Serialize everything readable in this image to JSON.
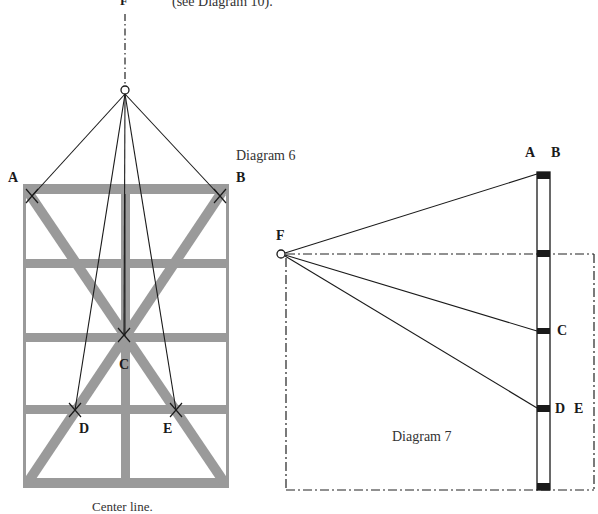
{
  "top_note": "(see Diagram 10).",
  "diagram6": {
    "caption": "Diagram 6",
    "footer": "Center line.",
    "labels": {
      "F": "F",
      "A": "A",
      "B": "B",
      "C": "C",
      "D": "D",
      "E": "E"
    },
    "frame_color": "#9a9a9a",
    "line_color": "#1a1a1a"
  },
  "diagram7": {
    "caption": "Diagram 7",
    "labels": {
      "F": "F",
      "A": "A",
      "B": "B",
      "C": "C",
      "D": "D",
      "E": "E"
    }
  }
}
